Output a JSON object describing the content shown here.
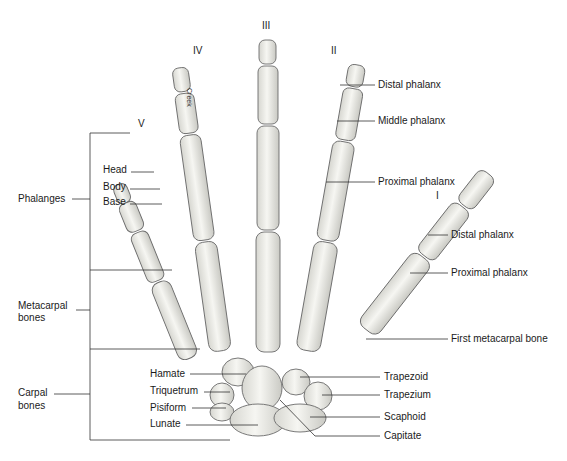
{
  "figure": {
    "finger_numerals": {
      "I": "I",
      "II": "II",
      "III": "III",
      "IV": "IV",
      "V": "V"
    },
    "signature": "Creek",
    "left_groups": {
      "phalanges": "Phalanges",
      "metacarpal_line1": "Metacarpal",
      "metacarpal_line2": "bones",
      "carpal_line1": "Carpal",
      "carpal_line2": "bones"
    },
    "phalanx_parts": {
      "head": "Head",
      "body": "Body",
      "base": "Base"
    },
    "finger_labels": {
      "distal": "Distal phalanx",
      "middle": "Middle phalanx",
      "proximal": "Proximal phalanx"
    },
    "thumb_labels": {
      "distal": "Distal phalanx",
      "proximal": "Proximal phalanx",
      "first_metacarpal": "First metacarpal bone"
    },
    "carpal_left": {
      "hamate": "Hamate",
      "triquetrum": "Triquetrum",
      "pisiform": "Pisiform",
      "lunate": "Lunate"
    },
    "carpal_right": {
      "trapezoid": "Trapezoid",
      "trapezium": "Trapezium",
      "scaphoid": "Scaphoid",
      "capitate": "Capitate"
    },
    "colors": {
      "bone_fill": "#eeeeea",
      "bone_stroke": "#6b6b6b",
      "leader_line": "#333333",
      "text": "#1a1a1a"
    }
  }
}
